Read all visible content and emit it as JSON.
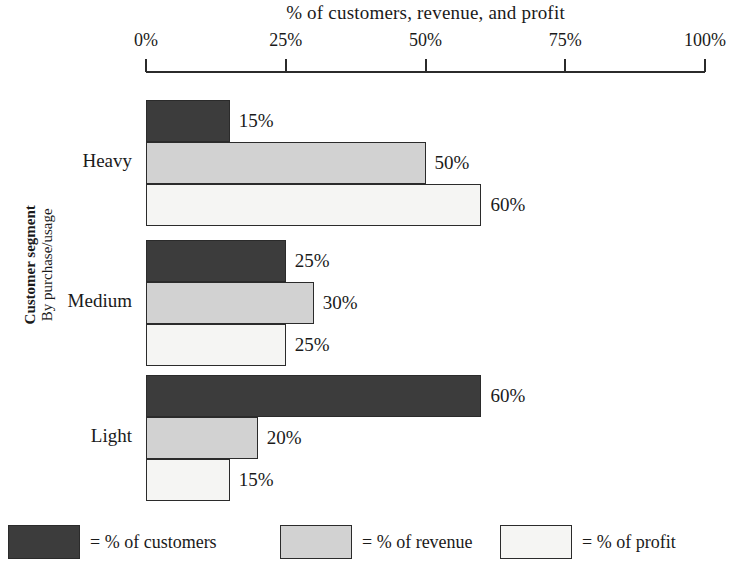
{
  "chart_data": {
    "type": "bar",
    "orientation": "horizontal",
    "title": "% of customers, revenue, and profit",
    "xlabel": "% of customers, revenue, and profit",
    "ylabel_bold": "Customer segment",
    "ylabel_sub": "By purchase/usage",
    "xlim": [
      0,
      100
    ],
    "grid": false,
    "legend_position": "bottom",
    "x_ticks": [
      {
        "value": 0,
        "label": "0%"
      },
      {
        "value": 25,
        "label": "25%"
      },
      {
        "value": 50,
        "label": "50%"
      },
      {
        "value": 75,
        "label": "75%"
      },
      {
        "value": 100,
        "label": "100%"
      }
    ],
    "categories": [
      "Heavy",
      "Medium",
      "Light"
    ],
    "series": [
      {
        "name": "% of customers",
        "key": "customers",
        "color": "#3c3c3c",
        "values": [
          15,
          25,
          60
        ],
        "labels": [
          "15%",
          "25%",
          "60%"
        ]
      },
      {
        "name": "% of revenue",
        "key": "revenue",
        "color": "#d2d2d2",
        "values": [
          50,
          30,
          20
        ],
        "labels": [
          "50%",
          "30%",
          "20%"
        ]
      },
      {
        "name": "% of profit",
        "key": "profit",
        "color": "#f5f5f3",
        "values": [
          60,
          25,
          15
        ],
        "labels": [
          "60%",
          "25%",
          "15%"
        ]
      }
    ],
    "groups": [
      {
        "label": "Heavy",
        "bars": [
          {
            "series": "% of customers",
            "key": "customers",
            "value": 15,
            "label": "15%"
          },
          {
            "series": "% of revenue",
            "key": "revenue",
            "value": 50,
            "label": "50%"
          },
          {
            "series": "% of profit",
            "key": "profit",
            "value": 60,
            "label": "60%"
          }
        ]
      },
      {
        "label": "Medium",
        "bars": [
          {
            "series": "% of customers",
            "key": "customers",
            "value": 25,
            "label": "25%"
          },
          {
            "series": "% of revenue",
            "key": "revenue",
            "value": 30,
            "label": "30%"
          },
          {
            "series": "% of profit",
            "key": "profit",
            "value": 25,
            "label": "25%"
          }
        ]
      },
      {
        "label": "Light",
        "bars": [
          {
            "series": "% of customers",
            "key": "customers",
            "value": 60,
            "label": "60%"
          },
          {
            "series": "% of revenue",
            "key": "revenue",
            "value": 20,
            "label": "20%"
          },
          {
            "series": "% of profit",
            "key": "profit",
            "value": 15,
            "label": "15%"
          }
        ]
      }
    ],
    "legend": [
      {
        "key": "customers",
        "prefix": "=",
        "label": "= % of customers",
        "color": "#3c3c3c"
      },
      {
        "key": "revenue",
        "prefix": "=",
        "label": "= % of revenue",
        "color": "#d2d2d2"
      },
      {
        "key": "profit",
        "prefix": "=",
        "label": "= % of profit",
        "color": "#f5f5f3"
      }
    ]
  },
  "layout": {
    "plot_left": 146,
    "plot_width": 559,
    "group_tops": [
      100,
      240,
      375
    ],
    "bar_height": 42,
    "legend_lefts": [
      8,
      280,
      500
    ]
  }
}
